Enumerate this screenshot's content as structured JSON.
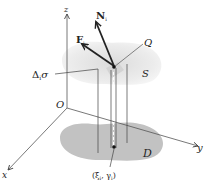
{
  "diagram": {
    "type": "3d-surface-integral-illustration",
    "axes": {
      "x_label": "x",
      "y_label": "y",
      "z_label": "z",
      "origin_label": "O"
    },
    "surface": {
      "label": "S",
      "color": "#e6e6e6"
    },
    "region": {
      "label": "D",
      "color": "#bdbdbd"
    },
    "point_on_surface": {
      "label": "Q"
    },
    "area_element": {
      "label": "Δ",
      "subscript": "i",
      "suffix": "σ"
    },
    "vectors": [
      {
        "name": "F",
        "subscript": "i"
      },
      {
        "name": "N",
        "subscript": "i"
      }
    ],
    "base_point": {
      "label": "(ξ",
      "sub1": "i",
      "mid": ", γ",
      "sub2": "i",
      "end": ")"
    }
  }
}
